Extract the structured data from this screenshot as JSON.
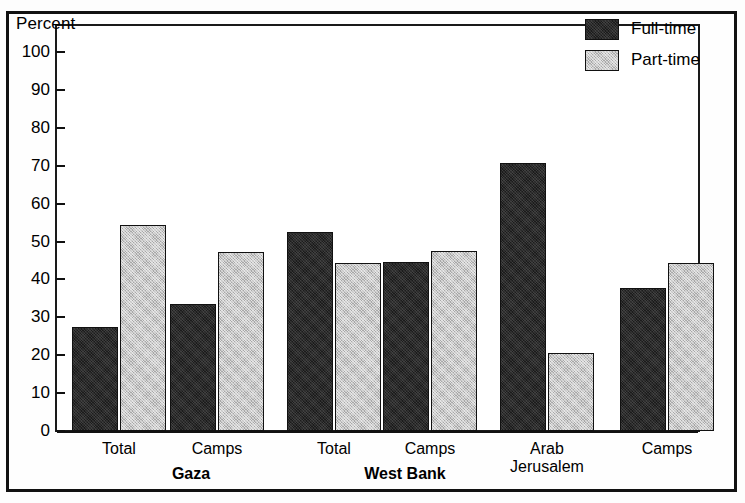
{
  "chart_data": {
    "type": "bar",
    "title": "",
    "ylabel": "Percent",
    "xlabel": "",
    "ylim": [
      0,
      100
    ],
    "ytick_values": [
      0,
      10,
      20,
      30,
      40,
      50,
      60,
      70,
      80,
      90,
      100
    ],
    "ytick_labels": [
      "0",
      "10",
      "20",
      "30",
      "40",
      "50",
      "60",
      "70",
      "80",
      "90",
      "100"
    ],
    "grid": false,
    "legend_position": "top-right",
    "categories": [
      "Total",
      "Camps",
      "Total",
      "Camps",
      "Arab Jerusalem",
      "Camps"
    ],
    "group_labels": [
      "Gaza",
      "West Bank"
    ],
    "series": [
      {
        "name": "Full-time",
        "color": "#2a2a2a",
        "values": [
          27.4,
          33.5,
          52.6,
          44.5,
          70.8,
          37.7
        ]
      },
      {
        "name": "Part-time",
        "color": "#c8c8c8",
        "values": [
          54.3,
          47.3,
          44.3,
          47.4,
          20.7,
          44.4
        ]
      }
    ]
  },
  "axis": {
    "ylabel": "Percent",
    "ticks": [
      {
        "label": "100",
        "value": 100
      },
      {
        "label": "90",
        "value": 90
      },
      {
        "label": "80",
        "value": 80
      },
      {
        "label": "70",
        "value": 70
      },
      {
        "label": "60",
        "value": 60
      },
      {
        "label": "50",
        "value": 50
      },
      {
        "label": "40",
        "value": 40
      },
      {
        "label": "30",
        "value": 30
      },
      {
        "label": "20",
        "value": 20
      },
      {
        "label": "10",
        "value": 10
      },
      {
        "label": "0",
        "value": 0
      }
    ]
  },
  "legend": {
    "items": [
      {
        "label": "Full-time",
        "swatch": "full"
      },
      {
        "label": "Part-time",
        "swatch": "part"
      }
    ]
  },
  "xaxis": {
    "categories": [
      {
        "label": "Total",
        "line2": ""
      },
      {
        "label": "Camps",
        "line2": ""
      },
      {
        "label": "Total",
        "line2": ""
      },
      {
        "label": "Camps",
        "line2": ""
      },
      {
        "label": "Arab",
        "line2": "Jerusalem"
      },
      {
        "label": "Camps",
        "line2": ""
      }
    ],
    "groups": [
      {
        "label": "Gaza"
      },
      {
        "label": "West Bank"
      }
    ]
  }
}
